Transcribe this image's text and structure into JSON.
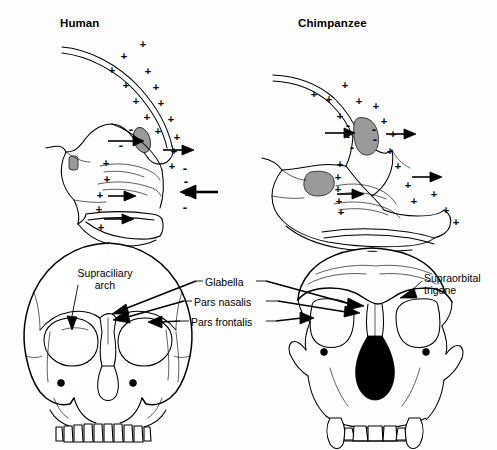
{
  "figure": {
    "background_color": "#fdfdfd",
    "ink_color": "#000000",
    "sinus_shade_color": "#9a9a9a",
    "nasal_aperture_color": "#000000"
  },
  "panels": {
    "top_left": {
      "title": "Human",
      "view": "mid-sagittal section",
      "deposition_symbol": "+",
      "resorption_symbol": "−"
    },
    "top_right": {
      "title": "Chimpanzee",
      "view": "mid-sagittal section",
      "deposition_symbol": "+",
      "resorption_symbol": "−"
    },
    "bottom_left": {
      "view": "frontal skull, human"
    },
    "bottom_right": {
      "view": "frontal skull, chimpanzee"
    }
  },
  "labels": {
    "supraciliary_arch": "Supraciliary arch",
    "supraciliary_arch_line1": "Supraciliary",
    "supraciliary_arch_line2": "arch",
    "glabella": "Glabella",
    "pars_nasalis": "Pars nasalis",
    "pars_frontalis": "Pars frontalis",
    "supraorbital_trigone": "Supraorbital trigone",
    "supraorbital_trigone_line1": "Supraorbital",
    "supraorbital_trigone_line2": "trigone"
  },
  "remodeling_markers": {
    "human": {
      "plus_count": 22,
      "minus_count": 8,
      "plus_positions": [
        [
          135,
          57
        ],
        [
          112,
          71
        ],
        [
          148,
          72
        ],
        [
          126,
          86
        ],
        [
          156,
          88
        ],
        [
          136,
          102
        ],
        [
          161,
          104
        ],
        [
          147,
          118
        ],
        [
          167,
          121
        ],
        [
          158,
          132
        ],
        [
          152,
          146
        ],
        [
          171,
          120
        ],
        [
          156,
          159
        ],
        [
          106,
          164
        ],
        [
          107,
          180
        ],
        [
          100,
          196
        ],
        [
          99,
          210
        ],
        [
          101,
          228
        ],
        [
          160,
          140
        ],
        [
          124,
          57
        ],
        [
          170,
          97
        ],
        [
          143,
          44
        ]
      ],
      "minus_positions": [
        [
          131,
          130
        ],
        [
          120,
          146
        ],
        [
          183,
          169
        ],
        [
          184,
          182
        ],
        [
          186,
          195
        ],
        [
          184,
          208
        ],
        [
          130,
          133
        ],
        [
          160,
          148
        ]
      ]
    },
    "chimpanzee": {
      "plus_count": 21,
      "minus_count": 5,
      "plus_positions": [
        [
          345,
          86
        ],
        [
          314,
          95
        ],
        [
          329,
          100
        ],
        [
          359,
          102
        ],
        [
          375,
          107
        ],
        [
          340,
          117
        ],
        [
          382,
          124
        ],
        [
          364,
          126
        ],
        [
          378,
          140
        ],
        [
          386,
          152
        ],
        [
          340,
          165
        ],
        [
          338,
          178
        ],
        [
          338,
          190
        ],
        [
          339,
          202
        ],
        [
          341,
          213
        ],
        [
          402,
          170
        ],
        [
          408,
          186
        ],
        [
          430,
          190
        ],
        [
          429,
          205
        ],
        [
          443,
          211
        ],
        [
          393,
          135
        ]
      ],
      "minus_positions": [
        [
          348,
          126
        ],
        [
          348,
          137
        ],
        [
          352,
          148
        ],
        [
          372,
          130
        ],
        [
          373,
          140
        ]
      ]
    }
  },
  "arrows": {
    "human": [
      {
        "name": "frontal-sinus-inward",
        "direction": "right"
      },
      {
        "name": "glabella-outward",
        "direction": "right"
      },
      {
        "name": "maxilla-inward",
        "direction": "right"
      },
      {
        "name": "palate-outward",
        "direction": "right"
      },
      {
        "name": "face-resorption-inward",
        "direction": "left"
      }
    ],
    "chimpanzee": [
      {
        "name": "frontal-sinus-inward",
        "direction": "right"
      },
      {
        "name": "glabella-outward",
        "direction": "right"
      },
      {
        "name": "maxilla-outward",
        "direction": "right"
      },
      {
        "name": "palate-outward",
        "direction": "right"
      }
    ]
  }
}
